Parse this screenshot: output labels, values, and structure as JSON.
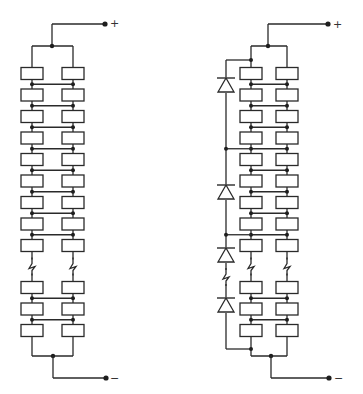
{
  "figure": {
    "colors": {
      "ink": "#2a2a2a",
      "background": "#ffffff"
    }
  },
  "circuits": [
    {
      "id": "left",
      "name": "string-without-bypass-diodes",
      "parallel_columns": 2,
      "cells_top_group": 9,
      "cells_bottom_group": 3,
      "break_symbol": true,
      "positive_terminal_label": "+",
      "negative_terminal_label": "−",
      "bypass_diodes": []
    },
    {
      "id": "right",
      "name": "string-with-bypass-diodes",
      "parallel_columns": 2,
      "cells_top_group": 9,
      "cells_bottom_group": 3,
      "break_symbol": true,
      "positive_terminal_label": "+",
      "negative_terminal_label": "−",
      "bypass_diodes": [
        {
          "index": 1,
          "spans_cells": "1-4",
          "orientation": "cathode-up"
        },
        {
          "index": 2,
          "spans_cells": "5-8",
          "orientation": "cathode-up"
        },
        {
          "index": 3,
          "spans_cells": "9-break",
          "orientation": "cathode-up"
        },
        {
          "index": 4,
          "spans_cells": "break-12",
          "orientation": "cathode-up"
        }
      ]
    }
  ]
}
